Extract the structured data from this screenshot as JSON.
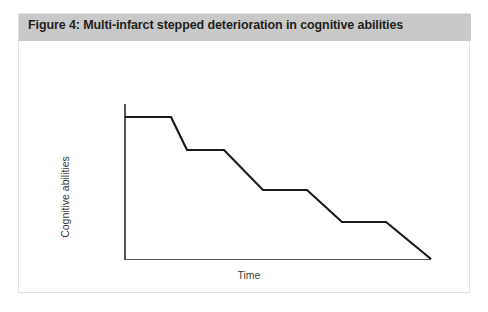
{
  "figure": {
    "title": "Figure 4: Multi-infarct stepped deterioration in cognitive abilities",
    "title_bar_color": "#c9c9c9",
    "title_text_color": "#231f20",
    "border_color": "#e2e2e2",
    "background_color": "#ffffff"
  },
  "chart_data": {
    "type": "line",
    "title": "Figure 4: Multi-infarct stepped deterioration in cognitive abilities",
    "xlabel": "Time",
    "ylabel": "Cognitive abilities",
    "axis_color": "#555555",
    "line_color": "#1a1a1a",
    "line_width": 2.2,
    "grid": false,
    "legend": null,
    "xlim": [
      0,
      100
    ],
    "ylim": [
      0,
      100
    ],
    "axis_tick_labels": {
      "x": [],
      "y": []
    },
    "x": [
      0,
      15,
      20,
      32,
      45,
      59,
      70,
      85,
      100
    ],
    "y": [
      100,
      100,
      77,
      77,
      49,
      49,
      26,
      26,
      0
    ],
    "segments": [
      {
        "kind": "plateau",
        "x_start": 0,
        "x_end": 15,
        "y": 100
      },
      {
        "kind": "drop",
        "x_start": 15,
        "x_end": 20,
        "y_start": 100,
        "y_end": 77
      },
      {
        "kind": "plateau",
        "x_start": 20,
        "x_end": 32,
        "y": 77
      },
      {
        "kind": "drop",
        "x_start": 32,
        "x_end": 45,
        "y_start": 77,
        "y_end": 49
      },
      {
        "kind": "plateau",
        "x_start": 45,
        "x_end": 59,
        "y": 49
      },
      {
        "kind": "drop",
        "x_start": 59,
        "x_end": 70,
        "y_start": 49,
        "y_end": 26
      },
      {
        "kind": "plateau",
        "x_start": 70,
        "x_end": 85,
        "y": 26
      },
      {
        "kind": "drop",
        "x_start": 85,
        "x_end": 100,
        "y_start": 26,
        "y_end": 0
      }
    ],
    "pixel_polyline": "106,76 152,76 168,109 205,109 244,149 288,149 323,181 367,181 412,218",
    "pixel_axes": {
      "y_axis": {
        "x": 106,
        "y_top": 63,
        "y_bottom": 219
      },
      "x_axis": {
        "y": 218,
        "x_left": 105,
        "x_right": 412
      }
    }
  }
}
